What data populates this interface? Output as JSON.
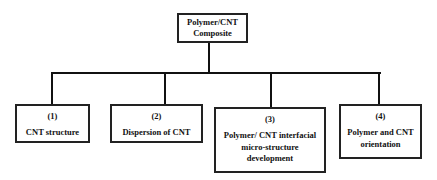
{
  "diagram": {
    "type": "hierarchy",
    "root": {
      "label_line1": "Polymer/CNT",
      "label_line2": "Composite"
    },
    "children": [
      {
        "number": "(1)",
        "label": "CNT structure"
      },
      {
        "number": "(2)",
        "label": "Dispersion of CNT"
      },
      {
        "number": "(3)",
        "label_lines": [
          "Polymer/ CNT interfacial",
          "micro-structure",
          "development"
        ]
      },
      {
        "number": "(4)",
        "label_lines": [
          "Polymer and CNT",
          "orientation"
        ]
      }
    ],
    "colors": {
      "line": "#111111",
      "border": "#222222",
      "background": "#ffffff"
    }
  }
}
